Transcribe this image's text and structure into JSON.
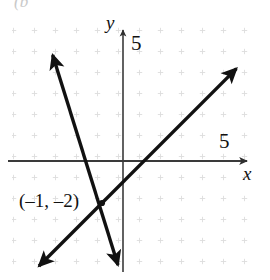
{
  "figure": {
    "kind": "coordinate-plane-line-graph",
    "corner_fragment": "(b",
    "axes": {
      "y_axis_name": "y",
      "x_axis_name": "x",
      "y_tick_label": "5",
      "x_tick_label": "5"
    },
    "annotations": [
      {
        "name": "intersection-label",
        "text": "(–1, –2)"
      }
    ]
  },
  "colors": {
    "ink": "#111111",
    "axis": "#3a3a3a",
    "grid_dot": "#d8d8d8",
    "background": "#ffffff"
  },
  "chart_data": {
    "type": "line",
    "title": "",
    "xlabel": "x",
    "ylabel": "y",
    "xlim": [
      -5.9,
      7.0
    ],
    "ylim": [
      -5.7,
      6.5
    ],
    "grid": true,
    "grid_spacing": 1,
    "legend": null,
    "axis_ticks": {
      "x": [
        5
      ],
      "y": [
        5
      ]
    },
    "origin_px": {
      "x": 123,
      "y": 161
    },
    "px_per_unit": 21,
    "series": [
      {
        "name": "line-1",
        "equation": "y = x - 1",
        "slope": 1,
        "intercept": -1,
        "x_intercept": 1,
        "arrow_both_ends": true,
        "endpoints": [
          {
            "x": -4.0,
            "y": -5.0
          },
          {
            "x": 5.4,
            "y": 4.4
          }
        ]
      },
      {
        "name": "line-2",
        "equation": "y = -3.2x - 5.2",
        "slope": -3.2,
        "intercept": -5.2,
        "x_intercept": -1.625,
        "arrow_both_ends": true,
        "endpoints": [
          {
            "x": -3.35,
            "y": 5.05
          },
          {
            "x": -0.24,
            "y": -4.95
          }
        ]
      }
    ],
    "points": [
      {
        "label": "(–1, –2)",
        "x": -1,
        "y": -2
      }
    ]
  }
}
